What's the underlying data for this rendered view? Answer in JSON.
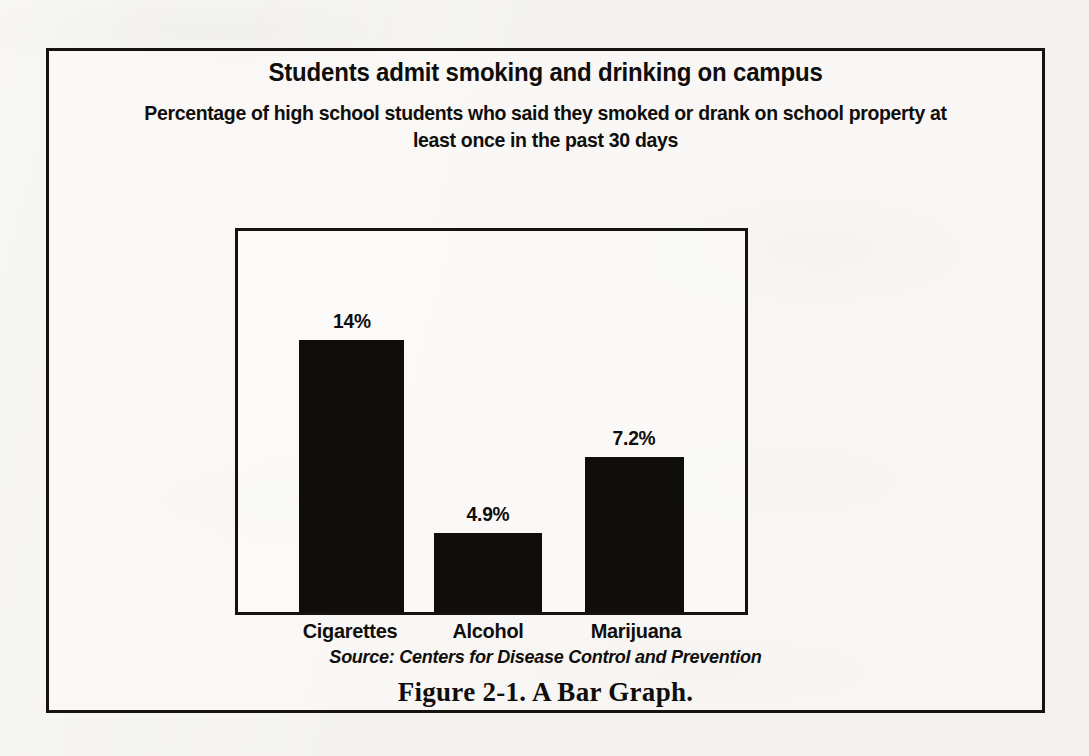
{
  "figure": {
    "title": "Students admit smoking and drinking on campus",
    "subtitle": "Percentage of high school students who said they smoked or drank on school property at least once in the past 30 days",
    "source": "Source: Centers for Disease Control and Prevention",
    "caption": "Figure 2-1.  A Bar Graph.",
    "frame_color": "#15130f",
    "bar_color": "#100e0c",
    "paper_color": "#f3f2ef"
  },
  "chart_data": {
    "type": "bar",
    "title": "Students admit smoking and drinking on campus",
    "subtitle": "Percentage of high school students who said they smoked or drank on school property at least once in the past 30 days",
    "categories": [
      "Cigarettes",
      "Alcohol",
      "Marijuana"
    ],
    "values": [
      14,
      4.9,
      7.2
    ],
    "value_labels": [
      "14%",
      "4.9%",
      "7.2%"
    ],
    "xlabel": "",
    "ylabel": "",
    "ylim": [
      0,
      19.5
    ],
    "grid": false,
    "legend": false,
    "axis_ticks_visible": false,
    "source": "Source: Centers for Disease Control and Prevention",
    "units": "percent"
  },
  "bars": [
    {
      "label": "Cigarettes",
      "value_label": "14%",
      "left_pct": 12.1,
      "width_pct": 20.7,
      "height_pct": 71.3,
      "label_center_pct": 22.4
    },
    {
      "label": "Alcohol",
      "value_label": "4.9%",
      "left_pct": 38.6,
      "width_pct": 21.4,
      "height_pct": 20.8,
      "label_center_pct": 49.3
    },
    {
      "label": "Marijuana",
      "value_label": "7.2%",
      "left_pct": 68.4,
      "width_pct": 19.5,
      "height_pct": 40.8,
      "label_center_pct": 78.2
    }
  ]
}
